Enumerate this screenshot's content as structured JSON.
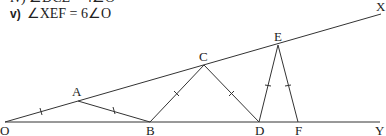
{
  "caption": {
    "partial_line": "iv) ∠DCE = 4∠O",
    "item_number": "v)",
    "statement": "∠XEF = 6∠O"
  },
  "diagram": {
    "stroke_color": "#333333",
    "points": {
      "O": {
        "label": "O",
        "x": 5,
        "y": 122
      },
      "A": {
        "label": "A",
        "x": 78,
        "y": 100
      },
      "B": {
        "label": "B",
        "x": 150,
        "y": 121
      },
      "C": {
        "label": "C",
        "x": 204,
        "y": 64
      },
      "D": {
        "label": "D",
        "x": 259,
        "y": 121
      },
      "E": {
        "label": "E",
        "x": 278,
        "y": 44
      },
      "F": {
        "label": "F",
        "x": 298,
        "y": 121
      },
      "X": {
        "label": "X",
        "x": 381,
        "y": 14
      },
      "Y": {
        "label": "Y",
        "x": 380,
        "y": 121
      }
    },
    "rays": [
      "OX",
      "OY"
    ],
    "segments": [
      "AB",
      "BC",
      "CD",
      "DE",
      "EF"
    ],
    "equal_marks": [
      "OA",
      "AB",
      "BC",
      "CD",
      "DE",
      "EF"
    ]
  }
}
